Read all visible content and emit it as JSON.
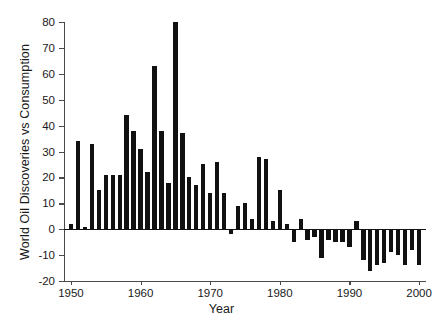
{
  "chart_data": {
    "type": "bar",
    "title": "",
    "xlabel": "Year",
    "ylabel": "World Oil Discoveries vs Consumption",
    "xlim": [
      1949,
      2001
    ],
    "ylim": [
      -20,
      80
    ],
    "grid": false,
    "legend": null,
    "bar_color": "#111111",
    "axis_color": "#4a4a4a",
    "yticks": [
      80,
      70,
      60,
      50,
      40,
      30,
      20,
      10,
      0,
      -10,
      -20
    ],
    "ytick_labels": [
      "80",
      "70",
      "60",
      "50",
      "40",
      "30",
      "20",
      "10",
      "0",
      "-10",
      "-20"
    ],
    "xticks": [
      1950,
      1960,
      1970,
      1980,
      1990,
      2000
    ],
    "xtick_labels": [
      "1950",
      "1960",
      "1970",
      "1980",
      "1990",
      "2000"
    ],
    "categories": [
      1950,
      1951,
      1952,
      1953,
      1954,
      1955,
      1956,
      1957,
      1958,
      1959,
      1960,
      1961,
      1962,
      1963,
      1964,
      1965,
      1966,
      1967,
      1968,
      1969,
      1970,
      1971,
      1972,
      1973,
      1974,
      1975,
      1976,
      1977,
      1978,
      1979,
      1980,
      1981,
      1982,
      1983,
      1984,
      1985,
      1986,
      1987,
      1988,
      1989,
      1990,
      1991,
      1992,
      1993,
      1994,
      1995,
      1996,
      1997,
      1998,
      1999,
      2000
    ],
    "values": [
      2,
      34,
      1,
      33,
      15,
      21,
      21,
      21,
      44,
      38,
      31,
      22,
      63,
      38,
      18,
      80,
      37,
      20,
      17,
      25,
      14,
      26,
      14,
      -2,
      9,
      10,
      4,
      28,
      27,
      3,
      15,
      2,
      -5,
      4,
      -4,
      -3,
      -11,
      -4,
      -5,
      -5,
      -7,
      3,
      -12,
      -16,
      -14,
      -13,
      -9,
      -10,
      -14,
      -8,
      -14
    ],
    "series_name": "World oil discoveries minus consumption"
  },
  "axis": {
    "ylabel": "World Oil Discoveries vs Consumption",
    "xlabel": "Year"
  }
}
